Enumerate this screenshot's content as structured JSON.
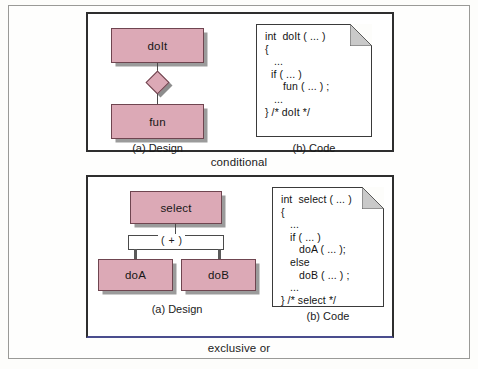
{
  "figure": {
    "colors": {
      "box_fill": "#dca9b6",
      "box_border": "#6f4550",
      "shadow": "#9b9b9b",
      "panel_border": "#2e2e2e",
      "page_border": "#9a9a97",
      "fold_fill": "#c9c9c9",
      "xor_panel_bottom_border": "#4a4d8e"
    },
    "blocks": [
      {
        "id": "conditional",
        "caption": "conditional",
        "design": {
          "label": "(a) Design",
          "boxes": [
            {
              "name": "doIt",
              "label": "doIt"
            },
            {
              "name": "fun",
              "label": "fun"
            }
          ],
          "connector": "diamond"
        },
        "code": {
          "label": "(b) Code",
          "lines": [
            "int  doIt ( ... )",
            "{",
            "   ...",
            "  if ( ... )",
            "      fun ( ... ) ;",
            "   ...",
            "} /* doIt */"
          ]
        }
      },
      {
        "id": "exclusive-or",
        "caption": "exclusive or",
        "design": {
          "label": "(a) Design",
          "boxes": [
            {
              "name": "select",
              "label": "select"
            },
            {
              "name": "doA",
              "label": "doA"
            },
            {
              "name": "doB",
              "label": "doB"
            }
          ],
          "connector": "plus-bar",
          "connector_label": "( + )"
        },
        "code": {
          "label": "(b) Code",
          "lines": [
            "int  select ( ... )",
            "{",
            "   ...",
            "   if ( ... )",
            "      doA ( ... );",
            "   else",
            "      doB ( ... ) ;",
            "   ...",
            "} /* select */"
          ]
        }
      }
    ]
  }
}
